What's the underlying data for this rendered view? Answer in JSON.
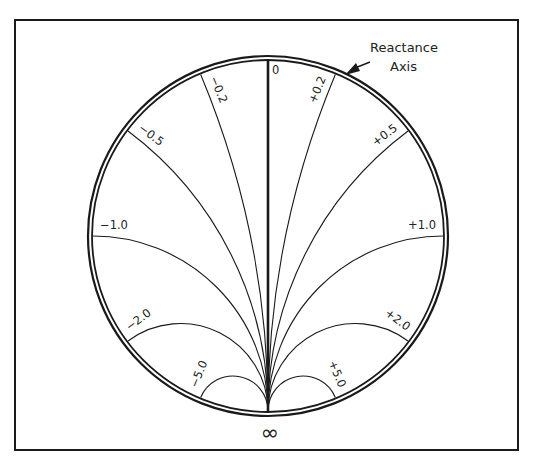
{
  "diagram": {
    "type": "smith-chart-reactance",
    "frame": {
      "x": 15,
      "y": 20,
      "width": 503,
      "height": 430
    },
    "circle": {
      "cx": 268,
      "cy": 236,
      "r_inner": 175,
      "r_outer": 181
    },
    "colors": {
      "stroke": "#1a1a1a",
      "background": "#ffffff",
      "text": "#222222"
    },
    "annotation": {
      "line1": "Reactance",
      "line2": "Axis"
    },
    "top_label": "0",
    "bottom_label": "∞",
    "reactance_values": [
      {
        "value": 0.2,
        "label": "+0.2"
      },
      {
        "value": 0.5,
        "label": "+0.5"
      },
      {
        "value": 1.0,
        "label": "+1.0"
      },
      {
        "value": 2.0,
        "label": "+2.0"
      },
      {
        "value": 5.0,
        "label": "+5.0"
      },
      {
        "value": -0.2,
        "label": "−0.2"
      },
      {
        "value": -0.5,
        "label": "−0.5"
      },
      {
        "value": -1.0,
        "label": "−1.0"
      },
      {
        "value": -2.0,
        "label": "−2.0"
      },
      {
        "value": -5.0,
        "label": "−5.0"
      }
    ]
  }
}
